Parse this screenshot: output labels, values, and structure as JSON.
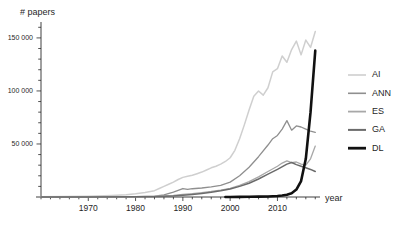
{
  "chart_data": {
    "type": "line",
    "title": "",
    "subtitle": "",
    "xlabel": "year",
    "ylabel": "# papers",
    "xlim": [
      1960,
      2019
    ],
    "ylim": [
      0,
      165000
    ],
    "grid": false,
    "legend_position": "right",
    "y_ticks_major": [
      50000,
      100000,
      150000
    ],
    "y_tick_labels": [
      "50 000",
      "100 000",
      "150 000"
    ],
    "y_tick_minor_step": 10000,
    "x_ticks_major": [
      1970,
      1980,
      1990,
      2000,
      2010
    ],
    "x_tick_labels": [
      "1970",
      "1980",
      "1990",
      "2000",
      "2010"
    ],
    "x_tick_minor_step": 2,
    "series": [
      {
        "name": "AI",
        "color": "#cfcfcf",
        "width": 1.5,
        "x": [
          1960,
          1965,
          1970,
          1975,
          1978,
          1980,
          1982,
          1984,
          1985,
          1986,
          1987,
          1988,
          1989,
          1990,
          1991,
          1992,
          1993,
          1994,
          1995,
          1996,
          1997,
          1998,
          1999,
          2000,
          2001,
          2002,
          2003,
          2004,
          2005,
          2006,
          2007,
          2008,
          2009,
          2010,
          2011,
          2012,
          2013,
          2014,
          2015,
          2016,
          2017,
          2018
        ],
        "values": [
          200,
          400,
          800,
          1500,
          2200,
          3000,
          4200,
          6000,
          8000,
          10000,
          12000,
          14000,
          16500,
          18500,
          19500,
          20500,
          22000,
          23500,
          25500,
          27500,
          29000,
          31000,
          33500,
          37000,
          44000,
          55000,
          68000,
          82000,
          95000,
          100000,
          96000,
          103000,
          118000,
          121000,
          133000,
          127000,
          139000,
          147000,
          134000,
          148000,
          141000,
          156000
        ]
      },
      {
        "name": "ANN",
        "color": "#8f8f8f",
        "width": 1.3,
        "x": [
          1960,
          1970,
          1980,
          1984,
          1986,
          1988,
          1990,
          1991,
          1992,
          1994,
          1996,
          1998,
          2000,
          2002,
          2004,
          2006,
          2008,
          2009,
          2010,
          2011,
          2012,
          2013,
          2014,
          2015,
          2016,
          2017,
          2018
        ],
        "values": [
          60,
          150,
          400,
          900,
          2000,
          4500,
          8000,
          7200,
          7800,
          8500,
          9500,
          11000,
          14000,
          20000,
          28000,
          38000,
          49000,
          55000,
          58000,
          64000,
          72000,
          63000,
          67000,
          66000,
          64000,
          62000,
          61000
        ]
      },
      {
        "name": "ES",
        "color": "#a8a8a8",
        "width": 1.3,
        "x": [
          1960,
          1970,
          1980,
          1985,
          1988,
          1990,
          1992,
          1994,
          1996,
          1998,
          2000,
          2002,
          2004,
          2006,
          2008,
          2010,
          2011,
          2012,
          2013,
          2014,
          2015,
          2016,
          2017,
          2018
        ],
        "values": [
          40,
          90,
          250,
          800,
          1600,
          2400,
          3200,
          4200,
          5200,
          6500,
          8200,
          11000,
          14500,
          19000,
          24000,
          29000,
          32000,
          34000,
          32500,
          33000,
          31000,
          30000,
          36000,
          48000
        ]
      },
      {
        "name": "GA",
        "color": "#6b6b6b",
        "width": 1.5,
        "x": [
          1960,
          1970,
          1980,
          1985,
          1988,
          1990,
          1992,
          1994,
          1996,
          1998,
          2000,
          2002,
          2004,
          2006,
          2008,
          2010,
          2012,
          2013,
          2014,
          2015,
          2016,
          2017,
          2018
        ],
        "values": [
          30,
          70,
          180,
          500,
          1000,
          1700,
          2400,
          3300,
          4400,
          5800,
          7600,
          10000,
          13000,
          17000,
          21500,
          26000,
          31000,
          32500,
          30500,
          29000,
          27500,
          26000,
          24000
        ]
      },
      {
        "name": "DL",
        "color": "#111111",
        "width": 2.6,
        "x": [
          1999,
          2000,
          2002,
          2004,
          2006,
          2008,
          2010,
          2011,
          2012,
          2013,
          2014,
          2015,
          2016,
          2017,
          2018
        ],
        "values": [
          40,
          60,
          120,
          200,
          320,
          520,
          900,
          1400,
          2200,
          3600,
          7000,
          15000,
          36000,
          80000,
          138000
        ]
      }
    ],
    "legend": [
      {
        "label": "AI",
        "color": "#cfcfcf",
        "width": 1.6
      },
      {
        "label": "ANN",
        "color": "#8f8f8f",
        "width": 1.6
      },
      {
        "label": "ES",
        "color": "#a8a8a8",
        "width": 1.8
      },
      {
        "label": "GA",
        "color": "#6b6b6b",
        "width": 2.0
      },
      {
        "label": "DL",
        "color": "#111111",
        "width": 2.8
      }
    ]
  },
  "axes": {
    "y_title": "# papers",
    "x_title": "year"
  }
}
